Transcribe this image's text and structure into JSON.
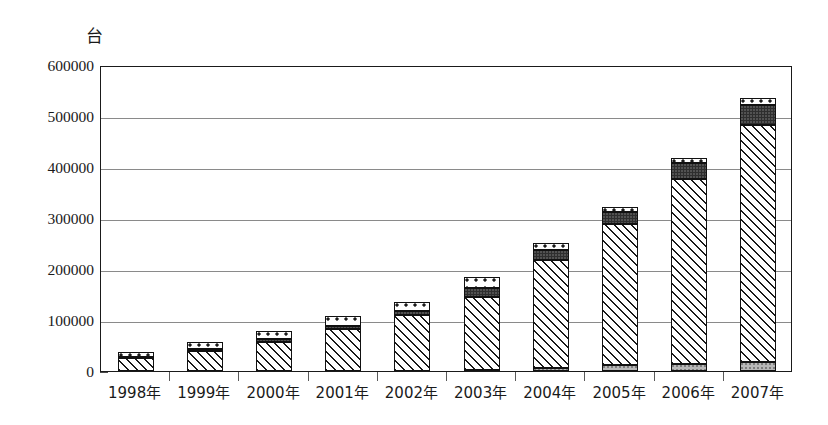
{
  "chart_data": {
    "type": "bar",
    "subtype": "stacked-bar",
    "title": "",
    "unit_label": "台",
    "xlabel": "",
    "ylabel": "",
    "ylim": [
      0,
      600000
    ],
    "ytick_step": 100000,
    "yticks": [
      "0",
      "100000",
      "200000",
      "300000",
      "400000",
      "500000",
      "600000"
    ],
    "grid": true,
    "legend": "none",
    "categories": [
      "1998年",
      "1999年",
      "2000年",
      "2001年",
      "2002年",
      "2003年",
      "2004年",
      "2005年",
      "2006年",
      "2007年"
    ],
    "series": [
      {
        "name": "segment-base",
        "pattern": "solid-gray",
        "values": [
          0,
          0,
          0,
          0,
          0,
          2000,
          6000,
          11000,
          14000,
          17000
        ]
      },
      {
        "name": "segment-hatched",
        "pattern": "diagonal-hatch",
        "values": [
          26000,
          40000,
          57000,
          83000,
          110000,
          143000,
          212000,
          277000,
          362000,
          466000
        ]
      },
      {
        "name": "segment-dark",
        "pattern": "solid-dark",
        "values": [
          2000,
          3000,
          5000,
          6000,
          8000,
          17000,
          20000,
          24000,
          31000,
          38000
        ]
      },
      {
        "name": "segment-dotted",
        "pattern": "white-dots",
        "values": [
          10000,
          13000,
          16000,
          19000,
          18000,
          22000,
          14000,
          10000,
          11000,
          14000
        ]
      }
    ],
    "totals": [
      38000,
      56000,
      78000,
      108000,
      136000,
      184000,
      252000,
      322000,
      418000,
      535000
    ]
  }
}
